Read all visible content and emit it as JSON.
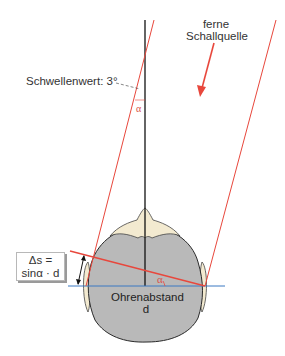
{
  "diagram": {
    "type": "sound-localization-geometry",
    "labels": {
      "threshold": "Schwellenwert: 3°",
      "source_line1": "ferne",
      "source_line2": "Schallquelle",
      "alpha_top": "α",
      "alpha_bottom": "α",
      "formula_line1": "Δs =",
      "formula_line2": "sinα · d",
      "distance_line1": "Ohrenabstand",
      "distance_line2": "d"
    },
    "colors": {
      "sound_rays": "#e8473c",
      "ear_axis": "#3b78c2",
      "midline": "#111111",
      "head_fill": "#b9b9b9",
      "head_outline": "#2a2a2a",
      "ear_nose_fill": "#f3ead0",
      "text": "#333333"
    }
  }
}
